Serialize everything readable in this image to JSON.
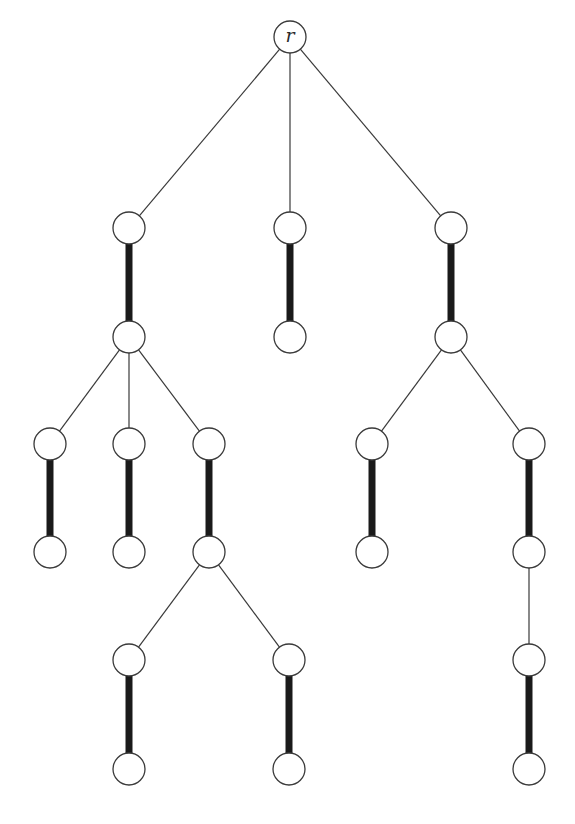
{
  "diagram": {
    "type": "rooted tree with matching",
    "root_label": "r",
    "node_radius": 16,
    "colors": {
      "background": "#ffffff",
      "stroke": "#3a3a3a",
      "matching_edge": "#1a1a1a"
    },
    "nodes": [
      {
        "id": "r",
        "x": 290,
        "y": 37,
        "label": "r"
      },
      {
        "id": "a1",
        "x": 129,
        "y": 228,
        "label": ""
      },
      {
        "id": "b1",
        "x": 290,
        "y": 228,
        "label": ""
      },
      {
        "id": "c1",
        "x": 451,
        "y": 228,
        "label": ""
      },
      {
        "id": "a2",
        "x": 129,
        "y": 337,
        "label": ""
      },
      {
        "id": "b2",
        "x": 290,
        "y": 337,
        "label": ""
      },
      {
        "id": "c2",
        "x": 451,
        "y": 337,
        "label": ""
      },
      {
        "id": "a3l",
        "x": 50,
        "y": 444,
        "label": ""
      },
      {
        "id": "a3m",
        "x": 129,
        "y": 444,
        "label": ""
      },
      {
        "id": "a3r",
        "x": 209,
        "y": 444,
        "label": ""
      },
      {
        "id": "c3l",
        "x": 372,
        "y": 444,
        "label": ""
      },
      {
        "id": "c3r",
        "x": 529,
        "y": 444,
        "label": ""
      },
      {
        "id": "a4l",
        "x": 50,
        "y": 552,
        "label": ""
      },
      {
        "id": "a4m",
        "x": 129,
        "y": 552,
        "label": ""
      },
      {
        "id": "a4r",
        "x": 209,
        "y": 552,
        "label": ""
      },
      {
        "id": "c4l",
        "x": 372,
        "y": 552,
        "label": ""
      },
      {
        "id": "c4r",
        "x": 529,
        "y": 552,
        "label": ""
      },
      {
        "id": "a5l",
        "x": 129,
        "y": 660,
        "label": ""
      },
      {
        "id": "a5r",
        "x": 289,
        "y": 660,
        "label": ""
      },
      {
        "id": "c5",
        "x": 529,
        "y": 660,
        "label": ""
      },
      {
        "id": "a6l",
        "x": 129,
        "y": 769,
        "label": ""
      },
      {
        "id": "a6r",
        "x": 289,
        "y": 769,
        "label": ""
      },
      {
        "id": "c6",
        "x": 529,
        "y": 769,
        "label": ""
      }
    ],
    "edges": [
      {
        "from": "r",
        "to": "a1",
        "matched": false
      },
      {
        "from": "r",
        "to": "b1",
        "matched": false
      },
      {
        "from": "r",
        "to": "c1",
        "matched": false
      },
      {
        "from": "a1",
        "to": "a2",
        "matched": true
      },
      {
        "from": "b1",
        "to": "b2",
        "matched": true
      },
      {
        "from": "c1",
        "to": "c2",
        "matched": true
      },
      {
        "from": "a2",
        "to": "a3l",
        "matched": false
      },
      {
        "from": "a2",
        "to": "a3m",
        "matched": false
      },
      {
        "from": "a2",
        "to": "a3r",
        "matched": false
      },
      {
        "from": "c2",
        "to": "c3l",
        "matched": false
      },
      {
        "from": "c2",
        "to": "c3r",
        "matched": false
      },
      {
        "from": "a3l",
        "to": "a4l",
        "matched": true
      },
      {
        "from": "a3m",
        "to": "a4m",
        "matched": true
      },
      {
        "from": "a3r",
        "to": "a4r",
        "matched": true
      },
      {
        "from": "c3l",
        "to": "c4l",
        "matched": true
      },
      {
        "from": "c3r",
        "to": "c4r",
        "matched": true
      },
      {
        "from": "a4r",
        "to": "a5l",
        "matched": false
      },
      {
        "from": "a4r",
        "to": "a5r",
        "matched": false
      },
      {
        "from": "c4r",
        "to": "c5",
        "matched": false
      },
      {
        "from": "a5l",
        "to": "a6l",
        "matched": true
      },
      {
        "from": "a5r",
        "to": "a6r",
        "matched": true
      },
      {
        "from": "c5",
        "to": "c6",
        "matched": true
      }
    ]
  }
}
